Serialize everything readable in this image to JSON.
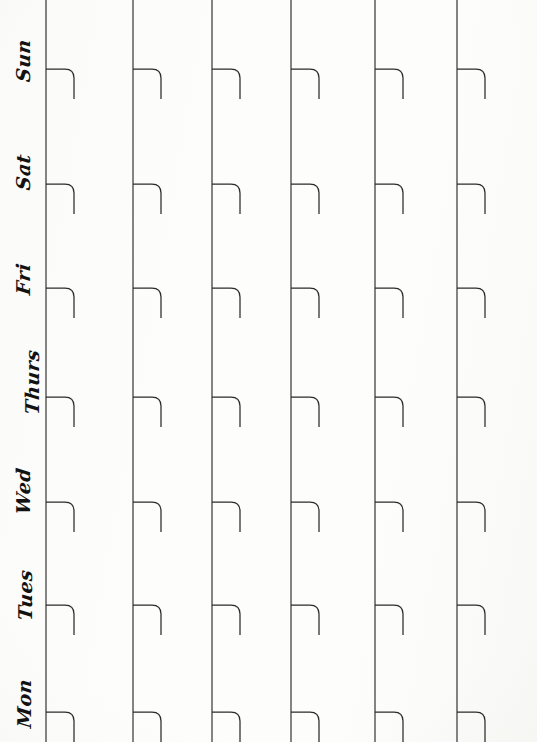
{
  "page": {
    "kind": "scanned-paper-weekly-planner",
    "width": 537,
    "height": 742,
    "paper_color": "#fdfdfc",
    "ink_color": "#2b2b2b",
    "handwriting_color": "#121212"
  },
  "rows": [
    {
      "label": "Sun",
      "name": "sunday",
      "label_y": 22,
      "baseline_y": 99
    },
    {
      "label": "Sat",
      "name": "saturday",
      "label_y": 130,
      "baseline_y": 214
    },
    {
      "label": "Fri",
      "name": "friday",
      "label_y": 240,
      "baseline_y": 318
    },
    {
      "label": "Thurs",
      "name": "thursday",
      "label_y": 337,
      "baseline_y": 427
    },
    {
      "label": "Wed",
      "name": "wednesday",
      "label_y": 450,
      "baseline_y": 532
    },
    {
      "label": "Tues",
      "name": "tuesday",
      "label_y": 555,
      "baseline_y": 635
    },
    {
      "label": "Mon",
      "name": "monday",
      "label_y": 665,
      "baseline_y": 742
    }
  ],
  "columns": [
    {
      "name": "column-1",
      "x": 46
    },
    {
      "name": "column-2",
      "x": 133
    },
    {
      "name": "column-3",
      "x": 212
    },
    {
      "name": "column-4",
      "x": 291
    },
    {
      "name": "column-5",
      "x": 375
    },
    {
      "name": "column-6",
      "x": 457
    }
  ],
  "row_lines": [
    {
      "y": 99,
      "x_start": 0,
      "x_end": 533
    },
    {
      "y": 214,
      "x_start": 0,
      "x_end": 532
    },
    {
      "y": 318,
      "x_start": 0,
      "x_end": 531
    },
    {
      "y": 427,
      "x_start": 0,
      "x_end": 533
    },
    {
      "y": 532,
      "x_start": 0,
      "x_end": 530
    },
    {
      "y": 635,
      "x_start": 0,
      "x_end": 534
    }
  ],
  "tab_hook": {
    "horizontal_run": 28,
    "corner_radius": 9,
    "drop_height": 30,
    "stroke_width": 1.25
  }
}
